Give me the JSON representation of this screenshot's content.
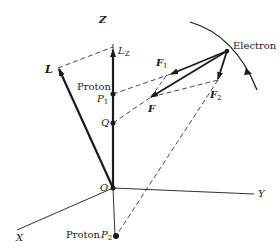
{
  "diagram": {
    "title": "",
    "axes": {
      "x_label": "X",
      "y_label": "Y",
      "z_label": "Z",
      "origin_label": "O"
    },
    "vectors": {
      "L": "L",
      "L_z_main": "L",
      "L_z_sub": "Z",
      "F": "F",
      "F1_main": "F",
      "F1_sub": "1",
      "F2_main": "F",
      "F2_sub": "2"
    },
    "points": {
      "proton1_text": "Proton",
      "P1_main": "P",
      "P1_sub": "1",
      "Q": "Q",
      "proton2_text": "Proton",
      "P2_main": "P",
      "P2_sub": "2",
      "electron": "Electron"
    },
    "colors": {
      "ink": "#1a1a1a",
      "background": "#ffffff"
    }
  }
}
